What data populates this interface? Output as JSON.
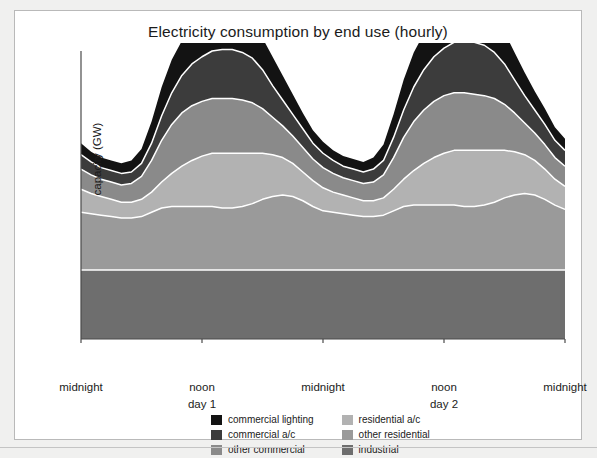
{
  "figure": {
    "title": "Electricity consumption by end use (hourly)",
    "ylabel": "capacity (GW)"
  },
  "axis": {
    "xticks": [
      {
        "label": "midnight",
        "sub": "",
        "hour": 0
      },
      {
        "label": "noon",
        "sub": "day 1",
        "hour": 12
      },
      {
        "label": "midnight",
        "sub": "",
        "hour": 24
      },
      {
        "label": "noon",
        "sub": "day 2",
        "hour": 36
      },
      {
        "label": "midnight",
        "sub": "",
        "hour": 48
      }
    ]
  },
  "legend": {
    "left_column": [
      {
        "label": "commercial lighting",
        "color": "#131313"
      },
      {
        "label": "commercial a/c",
        "color": "#3c3c3c"
      },
      {
        "label": "other commercial",
        "color": "#8a8a8a"
      }
    ],
    "right_column": [
      {
        "label": "residential a/c",
        "color": "#b2b2b2"
      },
      {
        "label": "other residential",
        "color": "#9a9a9a"
      },
      {
        "label": "industrial",
        "color": "#6e6e6e"
      }
    ]
  },
  "colors": {
    "commercial_lighting": "#131313",
    "commercial_ac": "#3c3c3c",
    "other_commercial": "#8a8a8a",
    "residential_ac": "#b2b2b2",
    "other_residential": "#9a9a9a",
    "industrial": "#6e6e6e",
    "separator": "#ffffff",
    "axis": "#4a4a4a",
    "title_text": "#1b1b1b"
  },
  "chart_data": {
    "type": "area",
    "title": "Electricity consumption by end use (hourly)",
    "xlabel": "",
    "ylabel": "capacity (GW)",
    "stacked": true,
    "grid": false,
    "legend_position": "bottom",
    "xlim": [
      0,
      48
    ],
    "ylim": [
      0,
      100
    ],
    "x": [
      0,
      1,
      2,
      3,
      4,
      5,
      6,
      7,
      8,
      9,
      10,
      11,
      12,
      13,
      14,
      15,
      16,
      17,
      18,
      19,
      20,
      21,
      22,
      23,
      24,
      25,
      26,
      27,
      28,
      29,
      30,
      31,
      32,
      33,
      34,
      35,
      36,
      37,
      38,
      39,
      40,
      41,
      42,
      43,
      44,
      45,
      46,
      47,
      48
    ],
    "x_tick_labels": [
      "midnight",
      "noon day 1",
      "midnight",
      "noon day 2",
      "midnight"
    ],
    "series": [
      {
        "name": "industrial",
        "color": "#6e6e6e",
        "values": [
          24,
          24,
          24,
          24,
          24,
          24,
          24,
          24,
          24,
          24,
          24,
          24,
          24,
          24,
          24,
          24,
          24,
          24,
          24,
          24,
          24,
          24,
          24,
          24,
          24,
          24,
          24,
          24,
          24,
          24,
          24,
          24,
          24,
          24,
          24,
          24,
          24,
          24,
          24,
          24,
          24,
          24,
          24,
          24,
          24,
          24,
          24,
          24,
          24
        ]
      },
      {
        "name": "other residential",
        "color": "#9a9a9a",
        "values": [
          20,
          19.5,
          19,
          18.5,
          18,
          18,
          18.5,
          20,
          21.5,
          22,
          22,
          22,
          22,
          22,
          21.5,
          21.5,
          22,
          23,
          24.5,
          25.5,
          26,
          25.5,
          24,
          22,
          20.5,
          20,
          19.5,
          19,
          18.5,
          18.5,
          19,
          20.5,
          22,
          22.5,
          22.5,
          22.5,
          22.5,
          22.5,
          22,
          22,
          22.5,
          23.5,
          25,
          26,
          26.5,
          26,
          24.5,
          22.5,
          21
        ]
      },
      {
        "name": "residential a/c",
        "color": "#b2b2b2",
        "values": [
          8,
          7,
          6.5,
          6,
          5.5,
          5.5,
          6,
          7,
          9,
          11.5,
          14,
          16,
          17.5,
          18.5,
          19,
          19,
          18.5,
          17.5,
          16,
          14.5,
          13,
          11.5,
          10,
          9,
          8,
          7,
          6.5,
          6,
          5.5,
          5.5,
          6,
          7.5,
          9.5,
          12,
          14.5,
          16.5,
          18,
          19,
          19.5,
          19.5,
          19,
          18,
          16.5,
          15,
          13.5,
          12,
          10.5,
          9,
          8
        ]
      },
      {
        "name": "other commercial",
        "color": "#8a8a8a",
        "values": [
          7,
          6.5,
          6,
          6,
          6,
          6.5,
          8,
          11,
          14.5,
          17,
          18.5,
          19,
          19,
          19,
          19,
          19,
          18.5,
          17.5,
          15.5,
          13,
          11,
          9.5,
          8.5,
          7.5,
          7,
          6.5,
          6,
          6,
          6,
          6.5,
          8,
          11,
          14.5,
          17,
          18.5,
          19.5,
          20,
          20,
          20,
          19.5,
          19,
          18,
          16,
          13.5,
          11,
          9.5,
          8.5,
          7.5,
          7
        ]
      },
      {
        "name": "commercial a/c",
        "color": "#3c3c3c",
        "values": [
          5,
          4.5,
          4,
          4,
          4,
          4,
          4.5,
          6,
          8.5,
          11,
          13,
          14.5,
          15.5,
          16.5,
          17,
          17,
          16.5,
          15.5,
          13.5,
          11,
          9,
          7.5,
          6.5,
          5.5,
          5,
          4.5,
          4,
          4,
          4,
          4.5,
          5,
          7,
          9.5,
          12,
          14,
          15.5,
          16.5,
          17.5,
          18,
          18,
          17.5,
          16,
          14,
          11.5,
          9.5,
          8,
          7,
          6,
          5.5
        ]
      },
      {
        "name": "commercial lighting",
        "color": "#131313",
        "values": [
          4,
          3.5,
          3.5,
          3.5,
          3.5,
          4,
          5,
          7.5,
          10,
          11.5,
          12,
          12,
          12,
          12,
          12,
          12,
          12,
          11.5,
          11,
          10,
          8.5,
          7,
          5.5,
          4.5,
          4,
          3.5,
          3.5,
          3.5,
          3.5,
          4,
          5.5,
          8,
          10.5,
          12,
          12.5,
          12.5,
          12.5,
          13,
          13,
          13,
          12.5,
          12,
          11,
          9.5,
          8,
          6.5,
          5.5,
          4.5,
          4
        ]
      }
    ]
  }
}
